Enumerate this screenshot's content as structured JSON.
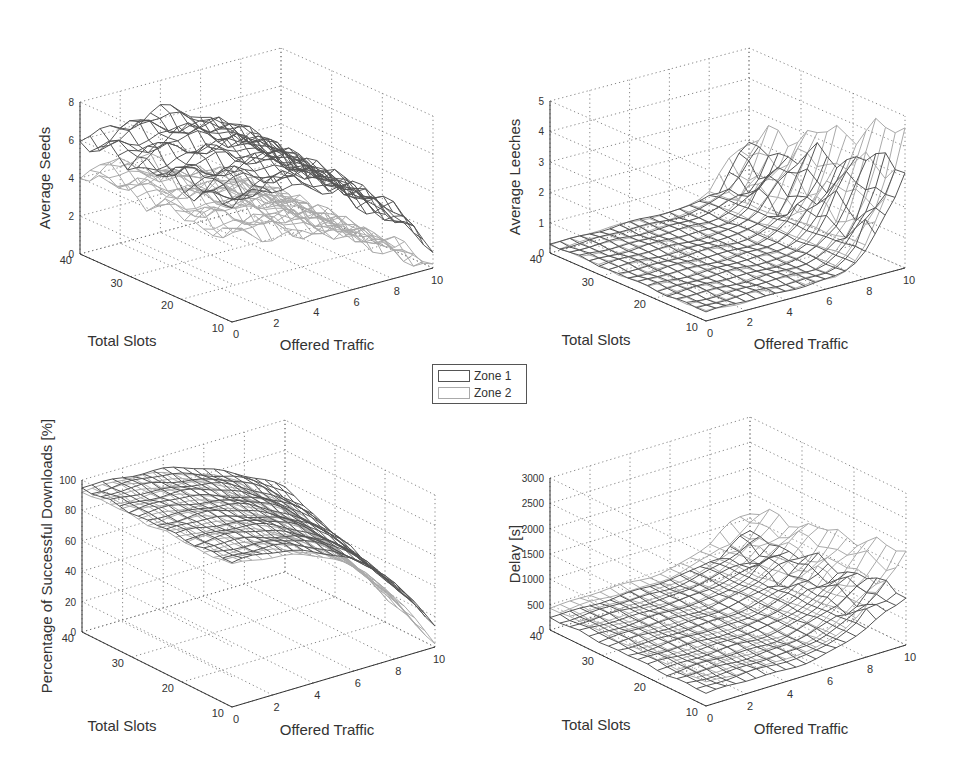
{
  "legend": {
    "items": [
      {
        "label": "Zone 1",
        "color": "#555555"
      },
      {
        "label": "Zone 2",
        "color": "#aaaaaa"
      }
    ]
  },
  "chart_data": [
    {
      "type": "surface",
      "id": "seeds",
      "title": "",
      "xlabel": "Offered Traffic",
      "ylabel": "Total Slots",
      "zlabel": "Average Seeds",
      "xticks": [
        0,
        2,
        4,
        6,
        8,
        10
      ],
      "yticks": [
        10,
        20,
        30,
        40
      ],
      "zticks": [
        0,
        2,
        4,
        6,
        8
      ],
      "xlim": [
        0,
        10
      ],
      "ylim": [
        10,
        40
      ],
      "zlim": [
        0,
        8
      ],
      "series": [
        {
          "name": "Zone 1",
          "description": "Bumpy surface ~5-7 at low/mid traffic, dropping to ~1 at traffic 10",
          "peak": 7.5,
          "at_x0": 5.3,
          "at_x10": 1.2
        },
        {
          "name": "Zone 2",
          "description": "Lower surface ~4-5 at low traffic, dropping to ~0 at traffic 10",
          "peak": 5,
          "at_x0": 4.5,
          "at_x10": 0.2
        }
      ]
    },
    {
      "type": "surface",
      "id": "leeches",
      "title": "",
      "xlabel": "Offered Traffic",
      "ylabel": "Total Slots",
      "zlabel": "Average Leeches",
      "xticks": [
        0,
        2,
        4,
        6,
        8,
        10
      ],
      "yticks": [
        10,
        20,
        30,
        40
      ],
      "zticks": [
        0,
        1,
        2,
        3,
        4,
        5
      ],
      "xlim": [
        0,
        10
      ],
      "ylim": [
        10,
        40
      ],
      "zlim": [
        0,
        5
      ],
      "series": [
        {
          "name": "Zone 1",
          "description": "Flat near ~0.3 until traffic ~7, rising to ~3 at traffic 10",
          "at_x0": 0.3,
          "at_x10": 3.2
        },
        {
          "name": "Zone 2",
          "description": "Flat near ~0.3 until traffic ~7, rising to ~4.2 at traffic 10",
          "at_x0": 0.3,
          "at_x10": 4.3
        }
      ]
    },
    {
      "type": "surface",
      "id": "success",
      "title": "",
      "xlabel": "Offered Traffic",
      "ylabel": "Total Slots",
      "zlabel": "Percentage of Successful Downloads [%]",
      "xticks": [
        0,
        2,
        4,
        6,
        8,
        10
      ],
      "yticks": [
        10,
        20,
        30,
        40
      ],
      "zticks": [
        0,
        20,
        40,
        60,
        80,
        100
      ],
      "xlim": [
        0,
        10
      ],
      "ylim": [
        10,
        40
      ],
      "zlim": [
        0,
        100
      ],
      "series": [
        {
          "name": "Zone 1",
          "description": "~95% at low traffic, dropping to ~15% at traffic 10 for small slots",
          "at_x0": 95,
          "at_x10": 15
        },
        {
          "name": "Zone 2",
          "description": "~93% at low traffic, dropping to ~2% at traffic 10",
          "at_x0": 93,
          "at_x10": 2
        }
      ]
    },
    {
      "type": "surface",
      "id": "delay",
      "title": "",
      "xlabel": "Offered Traffic",
      "ylabel": "Total Slots",
      "zlabel": "Delay [s]",
      "xticks": [
        0,
        2,
        4,
        6,
        8,
        10
      ],
      "yticks": [
        10,
        20,
        30,
        40
      ],
      "zticks": [
        0,
        500,
        1000,
        1500,
        2000,
        2500,
        3000
      ],
      "xlim": [
        0,
        10
      ],
      "ylim": [
        10,
        40
      ],
      "zlim": [
        0,
        3000
      ],
      "series": [
        {
          "name": "Zone 1",
          "description": "~200-300 s at low traffic, rising to ~1000 s at traffic 10",
          "at_x0": 250,
          "at_x10": 1050
        },
        {
          "name": "Zone 2",
          "description": "~400-500 s at low traffic, rising to ~1800 s at traffic 10",
          "at_x0": 450,
          "at_x10": 1800
        }
      ]
    }
  ]
}
